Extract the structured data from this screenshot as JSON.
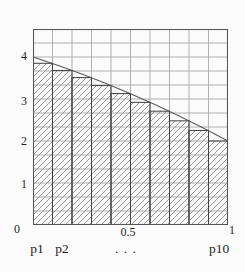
{
  "colors": {
    "background": "#fbfbfb",
    "grid_line": "#9e9e9e",
    "plot_border": "#555555",
    "bar_outline": "#414141",
    "hatch_line": "#8f8f8f",
    "curve_line": "#4f4f4f",
    "text": "#1e1e1e"
  },
  "chart_data": {
    "type": "bar",
    "subtype": "riemann-sum-rectangles-under-decreasing-curve",
    "title": "",
    "xlabel": "",
    "ylabel": "",
    "grid": "on",
    "x_axis": {
      "min": 0,
      "max": 1,
      "grid_step": 0.1,
      "tick_labels": [
        {
          "value": 0,
          "text": "0"
        },
        {
          "value": 0.5,
          "text": "0.5"
        },
        {
          "value": 1,
          "text": "1"
        }
      ]
    },
    "y_axis": {
      "min": 0,
      "max": 4.6667,
      "grid_step": 0.33333,
      "tick_labels": [
        {
          "value": 1,
          "text": "1"
        },
        {
          "value": 2,
          "text": "2"
        },
        {
          "value": 3,
          "text": "3"
        },
        {
          "value": 4,
          "text": "4"
        }
      ]
    },
    "bars": {
      "categories": [
        "p1",
        "p2",
        "p3",
        "p4",
        "p5",
        "p6",
        "p7",
        "p8",
        "p9",
        "p10"
      ],
      "left_edges": [
        0,
        0.1,
        0.2,
        0.3,
        0.4,
        0.5,
        0.6,
        0.7,
        0.8,
        0.9
      ],
      "width": 0.1,
      "heights": [
        3.85,
        3.68,
        3.51,
        3.32,
        3.13,
        2.92,
        2.71,
        2.48,
        2.25,
        2.0
      ],
      "fill": "diagonal-hatch"
    },
    "curve": {
      "shape": "concave-decreasing",
      "start": [
        0,
        4
      ],
      "control": [
        0.5,
        3.25
      ],
      "end": [
        1,
        2
      ]
    },
    "partition_labels": [
      {
        "text": "p1",
        "x": 0.05
      },
      {
        "text": "p2",
        "x": 0.15
      },
      {
        "text": ". . .",
        "x": 0.5
      },
      {
        "text": "p10",
        "x": 0.95
      }
    ]
  }
}
